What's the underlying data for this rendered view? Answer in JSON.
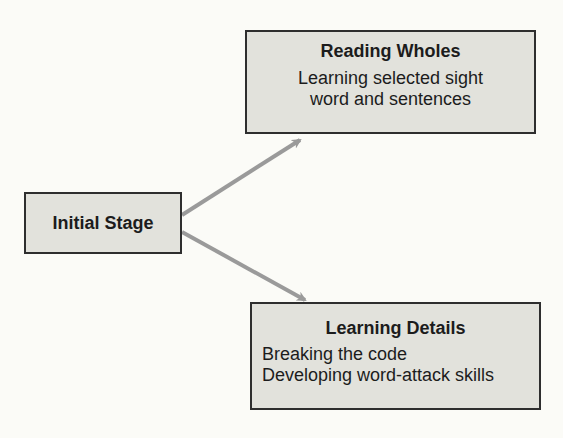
{
  "diagram": {
    "nodes": [
      {
        "id": "initial",
        "title": "Initial Stage",
        "lines": []
      },
      {
        "id": "reading_wholes",
        "title": "Reading Wholes",
        "lines": [
          "Learning selected sight",
          "word and sentences"
        ]
      },
      {
        "id": "learning_details",
        "title": "Learning Details",
        "lines": [
          "Breaking the code",
          "Developing word-attack skills"
        ]
      }
    ],
    "edges": [
      {
        "from": "initial",
        "to": "reading_wholes"
      },
      {
        "from": "initial",
        "to": "learning_details"
      }
    ],
    "colors": {
      "box_fill": "#e2e2dc",
      "box_border": "#2e2e2e",
      "arrow": "#9a9a9a",
      "background": "#fbfbf7"
    }
  }
}
